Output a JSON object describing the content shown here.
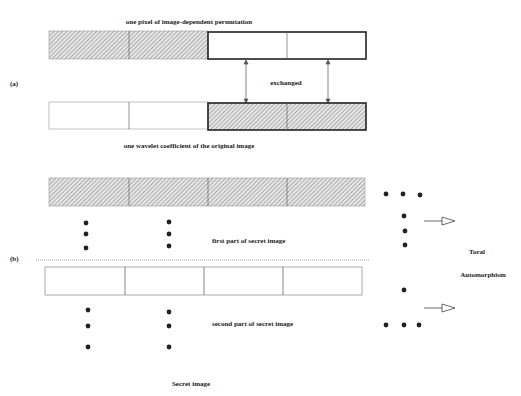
{
  "panel_a": {
    "tag": "(a)",
    "top_caption": "one pixel of image-dependent permutation",
    "middle_label": "exchanged",
    "bottom_caption": "one wavelet coefficient of the original image"
  },
  "panel_b": {
    "tag": "(b)",
    "first_part_label": "first part of secret image",
    "second_part_label": "second part of secret image",
    "bottom_caption": "Secret image",
    "right_label_line1": "Toral",
    "right_label_line2": "Automorphism"
  },
  "colors": {
    "line": "#333333",
    "hatch": "#888888"
  }
}
